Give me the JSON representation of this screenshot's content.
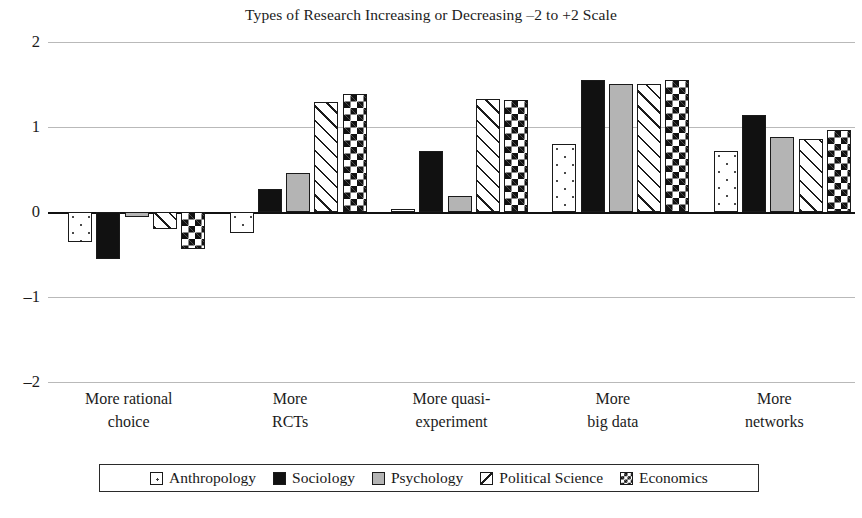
{
  "chart_data": {
    "type": "bar",
    "title": "Types of Research Increasing or Decreasing –2 to +2 Scale",
    "xlabel": "",
    "ylabel": "",
    "ylim": [
      -2,
      2
    ],
    "yticks": [
      "2",
      "1",
      "0",
      "–1",
      "–2"
    ],
    "ytick_values": [
      2,
      1,
      0,
      -1,
      -2
    ],
    "grid": true,
    "legend_position": "bottom",
    "categories": [
      "More rational choice",
      "More RCTs",
      "More quasi-experiment",
      "More big data",
      "More networks"
    ],
    "category_lines": [
      [
        "More rational",
        "choice"
      ],
      [
        "More",
        "RCTs"
      ],
      [
        "More quasi-",
        "experiment"
      ],
      [
        "More",
        "big data"
      ],
      [
        "More",
        "networks"
      ]
    ],
    "series": [
      {
        "name": "Anthropology",
        "pattern": "dotted",
        "values": [
          -0.35,
          -0.25,
          0.03,
          0.8,
          0.72
        ]
      },
      {
        "name": "Sociology",
        "pattern": "solid-black",
        "values": [
          -0.55,
          0.27,
          0.72,
          1.55,
          1.14
        ]
      },
      {
        "name": "Psychology",
        "pattern": "solid-gray",
        "values": [
          -0.06,
          0.46,
          0.19,
          1.51,
          0.88
        ]
      },
      {
        "name": "Political Science",
        "pattern": "diagonal",
        "values": [
          -0.2,
          1.3,
          1.33,
          1.51,
          0.86
        ]
      },
      {
        "name": "Economics",
        "pattern": "checkerboard",
        "values": [
          -0.43,
          1.39,
          1.32,
          1.55,
          0.96
        ]
      }
    ]
  },
  "colors": {
    "background": "#ffffff",
    "text": "#1b1b1b",
    "gridline": "#b9b9b9",
    "axis": "#111111",
    "sociology": "#111111",
    "psychology": "#b4b4b4"
  }
}
